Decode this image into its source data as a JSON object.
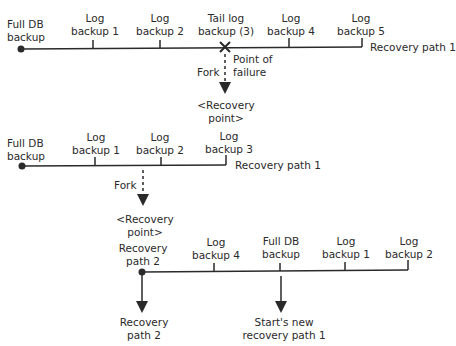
{
  "diagram": {
    "timeline1": {
      "start": "Full DB\nbackup",
      "events": [
        "Log\nbackup 1",
        "Log\nbackup 2",
        "Tail log\nbackup (3)",
        "Log\nbackup 4",
        "Log\nbackup 5"
      ],
      "path_label": "Recovery path 1",
      "failure_label": "Point of\nfailure",
      "fork_label": "Fork",
      "recovery_point": "<Recovery\npoint>"
    },
    "timeline2": {
      "start": "Full DB\nbackup",
      "events": [
        "Log\nbackup 1",
        "Log\nbackup 2",
        "Log\nbackup 3"
      ],
      "path_label": "Recovery path 1",
      "fork_label": "Fork",
      "recovery_point": "<Recovery\npoint>"
    },
    "timeline3": {
      "start": "Recovery\npath 2",
      "events": [
        "Log\nbackup 4",
        "Full DB\nbackup",
        "Log\nbackup 1",
        "Log\nbackup 2"
      ],
      "arrow_left_label": "Recovery\npath 2",
      "arrow_mid_label": "Start's new\nrecovery path 1"
    },
    "colors": {
      "line": "#2a2a2a",
      "background": "#ffffff"
    }
  }
}
